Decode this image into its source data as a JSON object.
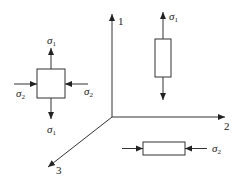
{
  "diagram": {
    "colors": {
      "stroke": "#333333",
      "background": "#ffffff"
    },
    "axes": [
      {
        "id": "axis-1",
        "label": "1"
      },
      {
        "id": "axis-2",
        "label": "2"
      },
      {
        "id": "axis-3",
        "label": "3"
      }
    ],
    "biaxial_element": {
      "top_label": "σ",
      "top_sub": "1",
      "bottom_label": "σ",
      "bottom_sub": "1",
      "left_label": "σ",
      "left_sub": "2",
      "right_label": "σ",
      "right_sub": "2"
    },
    "vertical_bar": {
      "label": "σ",
      "sub": "1"
    },
    "horizontal_bar": {
      "label": "σ",
      "sub": "2"
    }
  }
}
